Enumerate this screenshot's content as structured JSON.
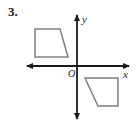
{
  "figure": {
    "problem_number": "3.",
    "background_color": "#ffffff",
    "axis_color": "#1a1a1a",
    "shape_color": "#808080",
    "label_color": "#1a1a1a"
  },
  "chart_data": {
    "type": "scatter",
    "title": "",
    "xlabel": "x",
    "ylabel": "y",
    "origin_label": "O",
    "grid": false,
    "legend": null,
    "axes": {
      "x_axis": {
        "label": "x",
        "arrow_start": true,
        "arrow_end": true,
        "pixel_y": 66,
        "pixel_x_start": 24,
        "pixel_x_end": 132
      },
      "y_axis": {
        "label": "y",
        "arrow_start": true,
        "arrow_end": true,
        "pixel_x": 77,
        "pixel_y_start": 12,
        "pixel_y_end": 122
      },
      "origin": {
        "pixel_x": 77,
        "pixel_y": 66
      }
    },
    "shapes": [
      {
        "name": "trapezoid-upper-left",
        "quadrant": "II",
        "vertices": [
          [
            35,
            29
          ],
          [
            60,
            29
          ],
          [
            68,
            57
          ],
          [
            35,
            57
          ]
        ],
        "closed": true,
        "stroke": "#808080",
        "fill": "none"
      },
      {
        "name": "trapezoid-lower-right",
        "quadrant": "IV",
        "vertices": [
          [
            85,
            78
          ],
          [
            118,
            78
          ],
          [
            118,
            106
          ],
          [
            98,
            106
          ]
        ],
        "closed": true,
        "stroke": "#808080",
        "fill": "none"
      }
    ],
    "annotations": [
      {
        "text": "3.",
        "pixel_x": 8,
        "pixel_y": 12
      },
      {
        "text": "O",
        "pixel_x": 70,
        "pixel_y": 76
      },
      {
        "text": "y",
        "pixel_x": 84,
        "pixel_y": 20
      },
      {
        "text": "x",
        "pixel_x": 126,
        "pixel_y": 76
      }
    ]
  }
}
